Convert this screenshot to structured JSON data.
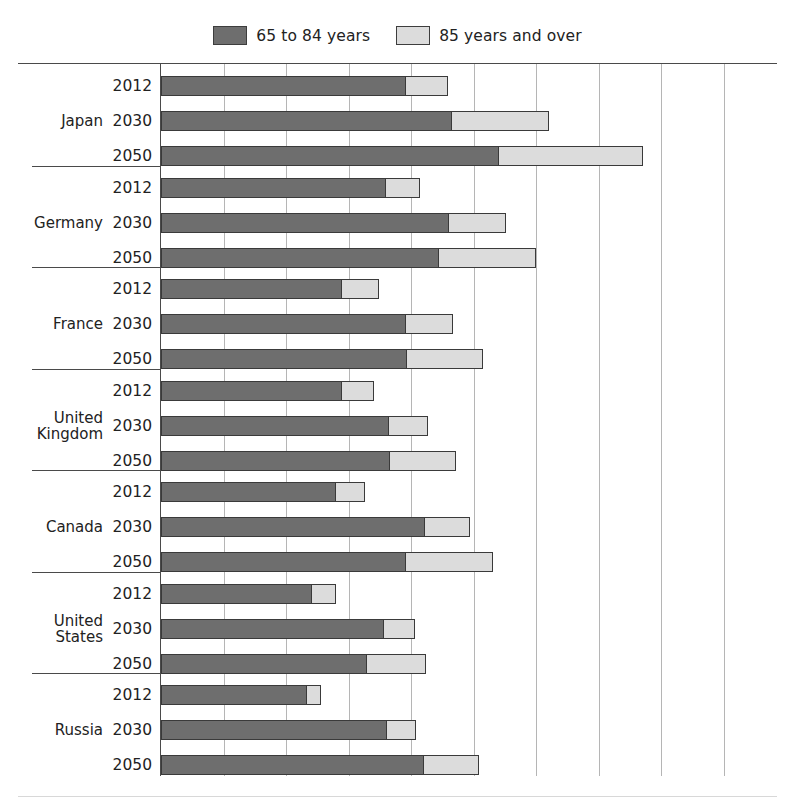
{
  "legend": {
    "items": [
      {
        "label": "65 to 84 years",
        "color": "#6e6e6e",
        "name": "legend-65-84"
      },
      {
        "label": "85 years and over",
        "color": "#dcdcdc",
        "name": "legend-85-plus"
      }
    ]
  },
  "axis": {
    "gridline_count": 9,
    "gridline_spacing_px": 62.5,
    "x_start_px": 160,
    "tick_values": [
      0,
      5,
      10,
      15,
      20,
      25,
      30,
      35,
      40,
      45
    ]
  },
  "chart_data": {
    "type": "bar",
    "orientation": "horizontal",
    "stacked": true,
    "title": "",
    "xlabel": "",
    "ylabel": "",
    "grid": true,
    "legend_position": "top-center",
    "xlim": [
      0,
      45
    ],
    "series": [
      {
        "name": "65 to 84 years",
        "color": "#6e6e6e"
      },
      {
        "name": "85 years and over",
        "color": "#dcdcdc"
      }
    ],
    "groups": [
      {
        "country": "Japan",
        "rows": [
          {
            "year": "2012",
            "values": [
              19.6,
              3.4
            ],
            "total": 23.0
          },
          {
            "year": "2030",
            "values": [
              23.3,
              7.8
            ],
            "total": 31.1
          },
          {
            "year": "2050",
            "values": [
              27.0,
              11.6
            ],
            "total": 38.6
          }
        ]
      },
      {
        "country": "Germany",
        "rows": [
          {
            "year": "2012",
            "values": [
              18.0,
              2.8
            ],
            "total": 20.8
          },
          {
            "year": "2030",
            "values": [
              23.0,
              4.7
            ],
            "total": 27.7
          },
          {
            "year": "2050",
            "values": [
              22.2,
              7.9
            ],
            "total": 30.1
          }
        ]
      },
      {
        "country": "France",
        "rows": [
          {
            "year": "2012",
            "values": [
              14.5,
              3.0
            ],
            "total": 17.5
          },
          {
            "year": "2030",
            "values": [
              19.6,
              3.8
            ],
            "total": 23.4
          },
          {
            "year": "2050",
            "values": [
              19.7,
              6.1
            ],
            "total": 25.8
          }
        ]
      },
      {
        "country": "United\nKingdom",
        "rows": [
          {
            "year": "2012",
            "values": [
              14.5,
              2.6
            ],
            "total": 17.1
          },
          {
            "year": "2030",
            "values": [
              18.2,
              3.2
            ],
            "total": 21.4
          },
          {
            "year": "2050",
            "values": [
              18.3,
              5.4
            ],
            "total": 23.7
          }
        ]
      },
      {
        "country": "Canada",
        "rows": [
          {
            "year": "2012",
            "values": [
              14.0,
              2.4
            ],
            "total": 16.4
          },
          {
            "year": "2030",
            "values": [
              21.1,
              3.7
            ],
            "total": 24.8
          },
          {
            "year": "2050",
            "values": [
              19.6,
              7.0
            ],
            "total": 26.6
          }
        ]
      },
      {
        "country": "United\nStates",
        "rows": [
          {
            "year": "2012",
            "values": [
              12.1,
              2.0
            ],
            "total": 14.1
          },
          {
            "year": "2030",
            "values": [
              17.8,
              2.6
            ],
            "total": 20.4
          },
          {
            "year": "2050",
            "values": [
              16.5,
              4.8
            ],
            "total": 21.3
          }
        ]
      },
      {
        "country": "Russia",
        "rows": [
          {
            "year": "2012",
            "values": [
              11.7,
              1.2
            ],
            "total": 12.9
          },
          {
            "year": "2030",
            "values": [
              18.1,
              2.4
            ],
            "total": 20.5
          },
          {
            "year": "2050",
            "values": [
              21.0,
              4.5
            ],
            "total": 25.5
          }
        ]
      }
    ]
  }
}
